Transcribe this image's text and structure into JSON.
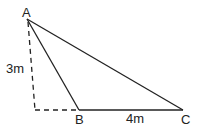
{
  "diagram": {
    "type": "geometry-triangle",
    "points": {
      "A": {
        "label": "A",
        "x": 27,
        "y": 19
      },
      "B": {
        "label": "B",
        "x": 79,
        "y": 110
      },
      "C": {
        "label": "C",
        "x": 183,
        "y": 110
      },
      "D": {
        "x": 35,
        "y": 110
      }
    },
    "labels": {
      "A": "A",
      "B": "B",
      "C": "C",
      "height": "3m",
      "base": "4m"
    },
    "edges": [
      {
        "from": "A",
        "to": "B",
        "style": "solid"
      },
      {
        "from": "A",
        "to": "C",
        "style": "solid"
      },
      {
        "from": "B",
        "to": "C",
        "style": "solid"
      },
      {
        "from": "A",
        "to": "D",
        "style": "dashed"
      },
      {
        "from": "D",
        "to": "B",
        "style": "dashed"
      }
    ],
    "colors": {
      "stroke": "#222222",
      "background": "#ffffff"
    }
  }
}
